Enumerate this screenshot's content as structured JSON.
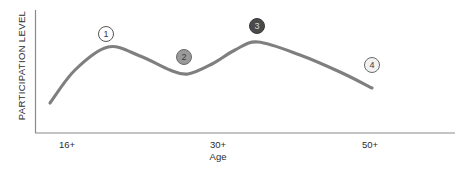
{
  "chart_data": {
    "type": "line",
    "title": "",
    "xlabel": "Age",
    "ylabel": "PARTICIPATION LEVEL",
    "grid": false,
    "legend": "none",
    "x_tick_labels": [
      "16+",
      "30+",
      "50+"
    ],
    "x_tick_positions": [
      67,
      218,
      370
    ],
    "xlim": [
      35,
      455
    ],
    "ylim_pixels": [
      133,
      10
    ],
    "series": [
      {
        "name": "Participation level by age",
        "points": [
          {
            "x": 50,
            "y": 103
          },
          {
            "x": 75,
            "y": 70
          },
          {
            "x": 108,
            "y": 47
          },
          {
            "x": 140,
            "y": 56
          },
          {
            "x": 170,
            "y": 70
          },
          {
            "x": 188,
            "y": 74
          },
          {
            "x": 212,
            "y": 64
          },
          {
            "x": 235,
            "y": 50
          },
          {
            "x": 258,
            "y": 42
          },
          {
            "x": 300,
            "y": 55
          },
          {
            "x": 340,
            "y": 72
          },
          {
            "x": 372,
            "y": 88
          }
        ]
      }
    ],
    "annotations": [
      {
        "label": "1",
        "x": 106,
        "y": 34,
        "fill": "#ffffff",
        "text_color": "#3a3a3a",
        "border": "#555555"
      },
      {
        "label": "2",
        "x": 184,
        "y": 57,
        "fill": "#9a9a9a",
        "text_color": "#3a3a3a",
        "border": "#6a6a6a"
      },
      {
        "label": "3",
        "x": 257,
        "y": 26,
        "fill": "#4a4a4a",
        "text_color": "#d8d8d8",
        "border": "#3a3a3a"
      },
      {
        "label": "4",
        "x": 372,
        "y": 65,
        "fill": "#f2f2f2",
        "text_color": "#3a3a3a",
        "border": "#6a6a6a"
      }
    ],
    "colors": {
      "curve": "#7f7f7f",
      "axis": "#8a8a8a",
      "text": "#2b2b2b",
      "background": "#ffffff"
    }
  }
}
